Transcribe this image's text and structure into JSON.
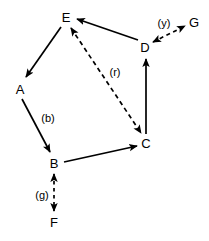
{
  "diagram": {
    "type": "directed-graph",
    "colors": {
      "stroke": "#000000",
      "background": "#ffffff",
      "text": "#000000"
    },
    "nodes": [
      {
        "id": "E",
        "label": "E",
        "x": 66,
        "y": 17
      },
      {
        "id": "G",
        "label": "G",
        "x": 194,
        "y": 22
      },
      {
        "id": "D",
        "label": "D",
        "x": 145,
        "y": 47
      },
      {
        "id": "A",
        "label": "A",
        "x": 20,
        "y": 89
      },
      {
        "id": "C",
        "label": "C",
        "x": 146,
        "y": 143
      },
      {
        "id": "B",
        "label": "B",
        "x": 54,
        "y": 163
      },
      {
        "id": "F",
        "label": "F",
        "x": 54,
        "y": 222
      }
    ],
    "edges": [
      {
        "id": "E-A",
        "from": "E",
        "to": "A",
        "style": "solid",
        "direction": "forward",
        "label": ""
      },
      {
        "id": "A-B",
        "from": "A",
        "to": "B",
        "style": "solid",
        "direction": "forward",
        "label": "(b)",
        "label_x": 48,
        "label_y": 118
      },
      {
        "id": "B-C",
        "from": "B",
        "to": "C",
        "style": "solid",
        "direction": "forward",
        "label": ""
      },
      {
        "id": "C-D",
        "from": "C",
        "to": "D",
        "style": "solid",
        "direction": "forward",
        "label": ""
      },
      {
        "id": "D-E",
        "from": "D",
        "to": "E",
        "style": "solid",
        "direction": "forward",
        "label": ""
      },
      {
        "id": "E-C",
        "from": "E",
        "to": "C",
        "style": "dashed",
        "direction": "bidirectional",
        "label": "(r)",
        "label_x": 115,
        "label_y": 72
      },
      {
        "id": "B-F",
        "from": "B",
        "to": "F",
        "style": "dashed",
        "direction": "bidirectional",
        "label": "(g)",
        "label_x": 42,
        "label_y": 195
      },
      {
        "id": "D-G",
        "from": "D",
        "to": "G",
        "style": "dashed",
        "direction": "bidirectional",
        "label": "(y)",
        "label_x": 164,
        "label_y": 23
      }
    ]
  }
}
